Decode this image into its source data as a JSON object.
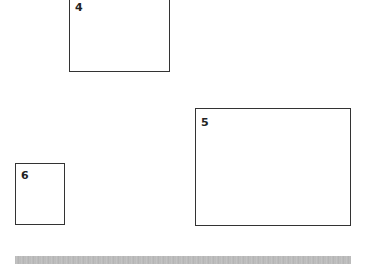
{
  "boxes": [
    {
      "id": "4",
      "label": "4"
    },
    {
      "id": "5",
      "label": "5"
    },
    {
      "id": "6",
      "label": "6"
    }
  ],
  "bar": {
    "color": "#bdbdbd"
  }
}
